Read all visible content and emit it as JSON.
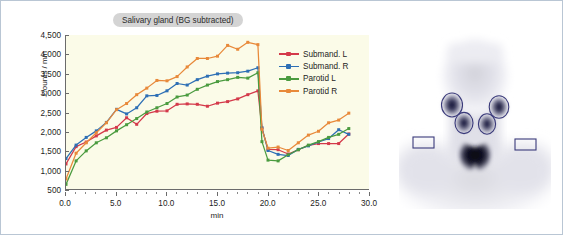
{
  "figure": {
    "frame_color": "#b9c6d4",
    "background": "#ffffff"
  },
  "chart_data": {
    "type": "line",
    "title": "Salivary gland (BG subtracted)",
    "xlabel": "min",
    "ylabel": "Counts / min",
    "xlim": [
      0.0,
      30.0
    ],
    "ylim": [
      500,
      4500
    ],
    "xticks": [
      "0.0",
      "5.0",
      "10.0",
      "15.0",
      "20.0",
      "25.0",
      "30.0"
    ],
    "xtick_values": [
      0,
      5,
      10,
      15,
      20,
      25,
      30
    ],
    "yticks": [
      "500",
      "1,000",
      "1,500",
      "2,000",
      "2,500",
      "3,000",
      "3,500",
      "4,000",
      "4,500"
    ],
    "ytick_values": [
      500,
      1000,
      1500,
      2000,
      2500,
      3000,
      3500,
      4000,
      4500
    ],
    "grid": false,
    "legend_position": "upper right",
    "plot_background": "#fbfbe8",
    "x": [
      0,
      1,
      2,
      3,
      4,
      5,
      6,
      7,
      8,
      9,
      10,
      11,
      12,
      13,
      14,
      15,
      16,
      17,
      18,
      19,
      19.4,
      20,
      21,
      22,
      23,
      24,
      25,
      26,
      27,
      28
    ],
    "series": [
      {
        "name": "Submand. L",
        "color": "#d4394a",
        "values": [
          1150,
          1600,
          1720,
          1880,
          2030,
          2100,
          2350,
          2180,
          2460,
          2520,
          2530,
          2700,
          2710,
          2700,
          2650,
          2730,
          2770,
          2840,
          2950,
          3050,
          2080,
          1530,
          1520,
          1410,
          1520,
          1630,
          1680,
          1680,
          1680,
          1930
        ]
      },
      {
        "name": "Submand. R",
        "color": "#2d6fb5",
        "values": [
          1290,
          1640,
          1840,
          2010,
          2230,
          2570,
          2450,
          2610,
          2920,
          2930,
          3050,
          3240,
          3200,
          3340,
          3430,
          3490,
          3510,
          3520,
          3560,
          3650,
          2090,
          1500,
          1400,
          1370,
          1530,
          1620,
          1720,
          1810,
          2040,
          1920
        ]
      },
      {
        "name": "Parotid L",
        "color": "#4a9b3f",
        "values": [
          620,
          1230,
          1490,
          1700,
          1830,
          2010,
          2170,
          2330,
          2500,
          2610,
          2720,
          2890,
          2940,
          3090,
          3200,
          3290,
          3340,
          3400,
          3380,
          3520,
          1730,
          1250,
          1230,
          1390,
          1520,
          1640,
          1730,
          1840,
          1920,
          2070
        ]
      },
      {
        "name": "Parotid R",
        "color": "#e8893a",
        "values": [
          760,
          1430,
          1700,
          1960,
          2220,
          2560,
          2720,
          2950,
          3120,
          3320,
          3310,
          3420,
          3670,
          3890,
          3890,
          3950,
          4230,
          4130,
          4310,
          4250,
          2050,
          1560,
          1590,
          1500,
          1700,
          1900,
          2000,
          2220,
          2290,
          2470
        ]
      }
    ]
  },
  "scan": {
    "modality_label": "salivary-gland-scintigram",
    "roi_outline_color": "#3a3a7a",
    "roi_regions": [
      "parotid-right",
      "parotid-left",
      "submandibular-right",
      "submandibular-left",
      "background-roi-right",
      "background-roi-left"
    ]
  }
}
